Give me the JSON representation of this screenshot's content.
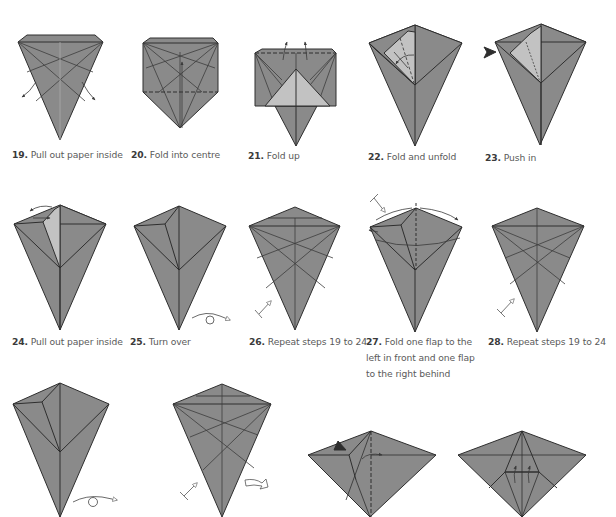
{
  "document": {
    "type": "origami instruction diagrams",
    "colors": {
      "paper": "#8a8a8a",
      "paper_light": "#c2c2c2",
      "crease": "#3c3c3c",
      "edge": "#2e2e2e",
      "caption_text": "#5a5a5a",
      "caption_number": "#3a3a3a"
    }
  },
  "steps": [
    {
      "number": "19.",
      "text": "Pull out paper inside"
    },
    {
      "number": "20.",
      "text": "Fold into centre"
    },
    {
      "number": "21.",
      "text": "Fold up"
    },
    {
      "number": "22.",
      "text": "Fold and unfold"
    },
    {
      "number": "23.",
      "text": "Push in"
    },
    {
      "number": "24.",
      "text": "Pull out paper inside"
    },
    {
      "number": "25.",
      "text": "Turn over"
    },
    {
      "number": "26.",
      "text": "Repeat steps 19 to 24"
    },
    {
      "number": "27.",
      "text": "Fold one flap to the",
      "line2": "left in front and one flap",
      "line3": "to the right behind"
    },
    {
      "number": "28.",
      "text": "Repeat steps 19 to 24"
    }
  ],
  "symbols": {
    "pull_arrows": "curved-arrow-icon",
    "turn_over": "turn-over-icon",
    "repeat": "repeat-steps-icon",
    "push_in": "push-arrow-icon",
    "rotate": "rotate-icon"
  }
}
